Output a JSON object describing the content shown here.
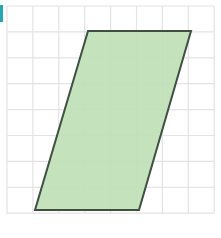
{
  "figure": {
    "type": "geometry-figure",
    "width": 221,
    "height": 238,
    "background_color": "#ffffff"
  },
  "grid": {
    "name": "square-grid",
    "line_color": "#e3e3e5",
    "line_width": 1.2,
    "cell_size": 25.9,
    "origin_x": 7,
    "origin_y": 6,
    "columns": 8,
    "rows": 8,
    "x_lines": [
      7,
      32.9,
      58.8,
      84.7,
      110.6,
      136.5,
      162.4,
      188.3,
      214.2
    ],
    "y_lines": [
      6,
      31.9,
      57.8,
      83.7,
      109.6,
      135.5,
      161.4,
      187.3,
      213.2
    ],
    "visible": true
  },
  "shape": {
    "name": "parallelogram",
    "kind": "parallelogram",
    "fill_color": "#bfe0b5",
    "fill_opacity": 0.92,
    "stroke_color": "#3f4f42",
    "stroke_width": 2,
    "points": "88,31 191,31 139,210 35,210",
    "vertices": [
      {
        "label": "top-left",
        "x": 88,
        "y": 31
      },
      {
        "label": "top-right",
        "x": 191,
        "y": 31
      },
      {
        "label": "bottom-right",
        "x": 139,
        "y": 210
      },
      {
        "label": "bottom-left",
        "x": 35,
        "y": 210
      }
    ],
    "base_cells": 4,
    "height_cells": 7,
    "slant_cells": 2
  },
  "marker": {
    "name": "teal-edge-marker",
    "color": "#2aa6b0",
    "x": 0,
    "y": 5,
    "width": 3,
    "height": 17,
    "visible": true
  }
}
